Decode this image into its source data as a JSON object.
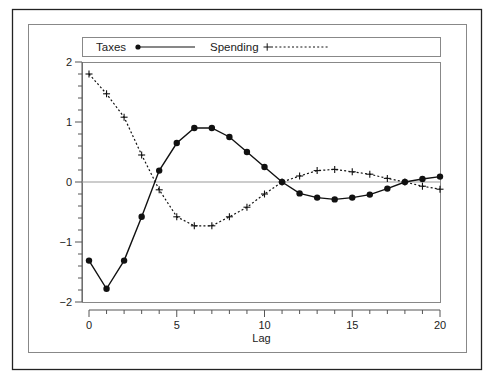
{
  "chart_data": {
    "type": "line",
    "title": "",
    "xlabel": "Lag",
    "ylabel": "",
    "xlim": [
      0,
      20
    ],
    "ylim": [
      -2,
      2
    ],
    "x_ticks": [
      0,
      5,
      10,
      15,
      20
    ],
    "x_tick_labels": [
      "0",
      "5",
      "10",
      "15",
      "20"
    ],
    "y_ticks": [
      -2,
      -1,
      0,
      1,
      2
    ],
    "y_tick_labels": [
      "−2",
      "−1",
      "0",
      "1",
      "2"
    ],
    "reference_line": 0,
    "grid": false,
    "legend_position": "top",
    "x": [
      0,
      1,
      2,
      3,
      4,
      5,
      6,
      7,
      8,
      9,
      10,
      11,
      12,
      13,
      14,
      15,
      16,
      17,
      18,
      19,
      20
    ],
    "series": [
      {
        "name": "Taxes",
        "marker": "filled-circle",
        "line_style": "solid",
        "color": "#111111",
        "values": [
          -1.31,
          -1.78,
          -1.31,
          -0.58,
          0.19,
          0.65,
          0.9,
          0.9,
          0.75,
          0.5,
          0.25,
          0.0,
          -0.19,
          -0.26,
          -0.29,
          -0.26,
          -0.21,
          -0.11,
          0.0,
          0.05,
          0.09
        ]
      },
      {
        "name": "Spending",
        "marker": "plus",
        "line_style": "dotted",
        "color": "#111111",
        "values": [
          1.8,
          1.47,
          1.08,
          0.45,
          -0.13,
          -0.58,
          -0.73,
          -0.73,
          -0.58,
          -0.42,
          -0.2,
          0.0,
          0.1,
          0.19,
          0.21,
          0.17,
          0.13,
          0.06,
          0.0,
          -0.07,
          -0.12
        ]
      }
    ]
  },
  "legend": {
    "taxes_label": "Taxes",
    "spending_label": "Spending"
  },
  "axes": {
    "xlabel": "Lag"
  },
  "colors": {
    "frame_outer": "#222222",
    "frame_inner": "#888888",
    "axis": "#555555",
    "zero_line": "#999999",
    "series": "#111111"
  }
}
